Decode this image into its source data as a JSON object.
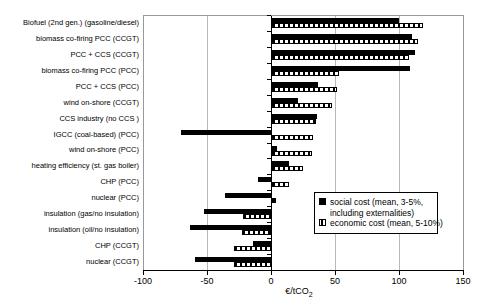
{
  "chart_data": {
    "type": "bar",
    "orientation": "horizontal",
    "title": "",
    "xlabel": "€/tCO2",
    "xlabel_base": "€/tCO",
    "xlabel_subscript": "2",
    "xlim": [
      -100,
      150
    ],
    "xticks": [
      -100,
      -50,
      0,
      50,
      100,
      150
    ],
    "grid": "vertical gridlines at 50-unit intervals",
    "legend_position": "inside right, middle",
    "colors": {
      "bar": "#000000",
      "gridline": "#b8b8b8",
      "plot_border": "#999999",
      "background": "#ffffff"
    },
    "categories": [
      "Biofuel (2nd gen.) (gasoline/diesel)",
      "biomass co-firing PCC (CCGT)",
      "PCC + CCS (CCGT)",
      "biomass co-firing PCC (PCC)",
      "PCC + CCS (PCC)",
      "wind on-shore (CCGT)",
      "CCS industry (no CCS )",
      "IGCC (coal-based) (PCC)",
      "wind on-shore (PCC)",
      "heating efficiency (st. gas boiler)",
      "CHP (PCC)",
      "nuclear (PCC)",
      "insulation (gas/no insulation)",
      "insulation (oil/no insulation)",
      "CHP (CCGT)",
      "nuclear (CCGT)"
    ],
    "series": [
      {
        "name": "social cost (mean, 3-5%, including externalities)",
        "style": "solid",
        "values": [
          99,
          109,
          112,
          108,
          36,
          20,
          35,
          -70,
          4,
          13,
          -10,
          -36,
          -52,
          -63,
          -14,
          -59
        ]
      },
      {
        "name": "economic cost (mean, 5-10%)",
        "style": "striped",
        "values": [
          118,
          114,
          107,
          52,
          51,
          47,
          34,
          32,
          31,
          24,
          13,
          3,
          -22,
          -23,
          -29,
          -29
        ]
      }
    ]
  },
  "legend": {
    "items": [
      {
        "line1": "social cost (mean, 3-5%,",
        "line2": "including externalities)"
      },
      {
        "line1": "economic cost (mean, 5-10%)"
      }
    ]
  },
  "axis": {
    "tick_labels": [
      "-100",
      "-50",
      "0",
      "50",
      "100",
      "150"
    ]
  }
}
